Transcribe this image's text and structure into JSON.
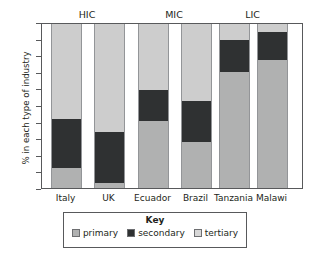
{
  "caption_fragment": "g  p                                                   p  y  g",
  "chart_data": {
    "type": "bar",
    "stacked": true,
    "title": "",
    "xlabel": "",
    "ylabel": "% in each type of industry",
    "ylim": [
      0,
      100
    ],
    "ytick_values": [
      0,
      10,
      20,
      30,
      40,
      50,
      60,
      70,
      80,
      90,
      100
    ],
    "ytick_labels": [
      "0",
      "10",
      "20",
      "30",
      "40",
      "50",
      "60",
      "70",
      "80",
      "90",
      "100"
    ],
    "grid": false,
    "legend_position": "bottom",
    "legend_title": "Key",
    "categories": [
      "Italy",
      "UK",
      "Ecuador",
      "Brazil",
      "Tanzania",
      "Malawi"
    ],
    "groups": [
      {
        "label": "HIC",
        "categories": [
          "Italy",
          "UK"
        ]
      },
      {
        "label": "MIC",
        "categories": [
          "Ecuador",
          "Brazil"
        ]
      },
      {
        "label": "LIC",
        "categories": [
          "Tanzania",
          "Malawi"
        ]
      }
    ],
    "series": [
      {
        "name": "primary",
        "color": "#b0b1b1",
        "values": [
          12,
          3,
          41,
          28,
          71,
          78
        ]
      },
      {
        "name": "secondary",
        "color": "#2f3132",
        "values": [
          30,
          31,
          19,
          25,
          19,
          17
        ]
      },
      {
        "name": "tertiary",
        "color": "#cdcdcd",
        "values": [
          58,
          66,
          40,
          47,
          10,
          5
        ]
      }
    ],
    "cumulative_tops": {
      "primary": [
        12,
        3,
        41,
        28,
        71,
        78
      ],
      "secondary": [
        42,
        34,
        60,
        53,
        90,
        95
      ],
      "tertiary": [
        100,
        100,
        100,
        100,
        100,
        100
      ]
    }
  },
  "legend": {
    "title": "Key",
    "items": [
      {
        "label": "primary",
        "swatch": "primary"
      },
      {
        "label": "secondary",
        "swatch": "secondary"
      },
      {
        "label": "tertiary",
        "swatch": "tertiary"
      }
    ]
  }
}
